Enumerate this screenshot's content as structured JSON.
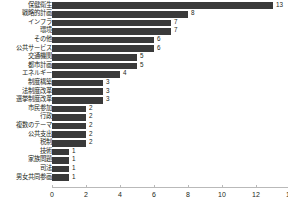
{
  "chart_data": {
    "type": "bar",
    "orientation": "horizontal",
    "title": "",
    "subtitle": "",
    "xlabel": "",
    "ylabel": "",
    "xlim": [
      0,
      14
    ],
    "xticks": [
      0,
      2,
      4,
      6,
      8,
      10,
      12,
      14
    ],
    "grid": false,
    "legend": false,
    "bar_color": "#3a3a3a",
    "text_color": "#231f20",
    "axis_color": "#b9b9b9",
    "categories": [
      "保健衛生",
      "戦略的計画",
      "インフラ",
      "環境",
      "その他",
      "公共サービス",
      "交通機関",
      "都市計画",
      "エネルギー",
      "制度構築",
      "法制度改革",
      "選挙制度改革",
      "市民参加",
      "行政",
      "複数のテーマ",
      "公共支出",
      "税制",
      "技術",
      "家族問題",
      "司法",
      "男女共同参画"
    ],
    "values": [
      13,
      8,
      7,
      7,
      6,
      6,
      5,
      5,
      4,
      3,
      3,
      3,
      2,
      2,
      2,
      2,
      2,
      1,
      1,
      1,
      1
    ],
    "data_labels": [
      "13",
      "8",
      "7",
      "7",
      "6",
      "6",
      "5",
      "5",
      "4",
      "3",
      "3",
      "3",
      "2",
      "2",
      "2",
      "2",
      "2",
      "1",
      "1",
      "1",
      "1"
    ],
    "xtick_labels": [
      "0",
      "2",
      "4",
      "6",
      "8",
      "10",
      "12",
      "14"
    ]
  }
}
